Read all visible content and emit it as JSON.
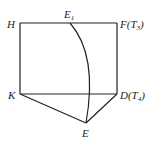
{
  "diagram": {
    "points": {
      "H": {
        "label": "H",
        "x": 20,
        "y": 23
      },
      "E1": {
        "label": "E",
        "sub": "1",
        "x": 70,
        "y": 23
      },
      "F": {
        "label": "F(T",
        "sub": "3",
        "suffix": ")",
        "x": 117,
        "y": 23
      },
      "K": {
        "label": "K",
        "x": 20,
        "y": 94
      },
      "D": {
        "label": "D(T",
        "sub": "4",
        "suffix": ")",
        "x": 117,
        "y": 94
      },
      "E": {
        "label": "E",
        "x": 86,
        "y": 123
      }
    },
    "segments": [
      [
        "H",
        "F"
      ],
      [
        "H",
        "K"
      ],
      [
        "F",
        "D"
      ],
      [
        "K",
        "D"
      ],
      [
        "K",
        "E"
      ],
      [
        "D",
        "E"
      ]
    ],
    "curve": {
      "from": "E1",
      "to": "E",
      "description": "arc from E1 bulging right down to E"
    },
    "stroke_color": "#222222"
  }
}
